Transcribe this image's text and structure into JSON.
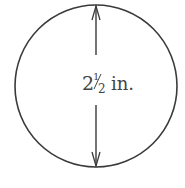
{
  "diagram": {
    "shape": "circle",
    "dimension": "diameter",
    "label": {
      "whole": "2",
      "fraction_num": "1",
      "fraction_den": "2",
      "unit": "in."
    },
    "colors": {
      "stroke": "#3a3a3a",
      "text": "#444444"
    }
  }
}
